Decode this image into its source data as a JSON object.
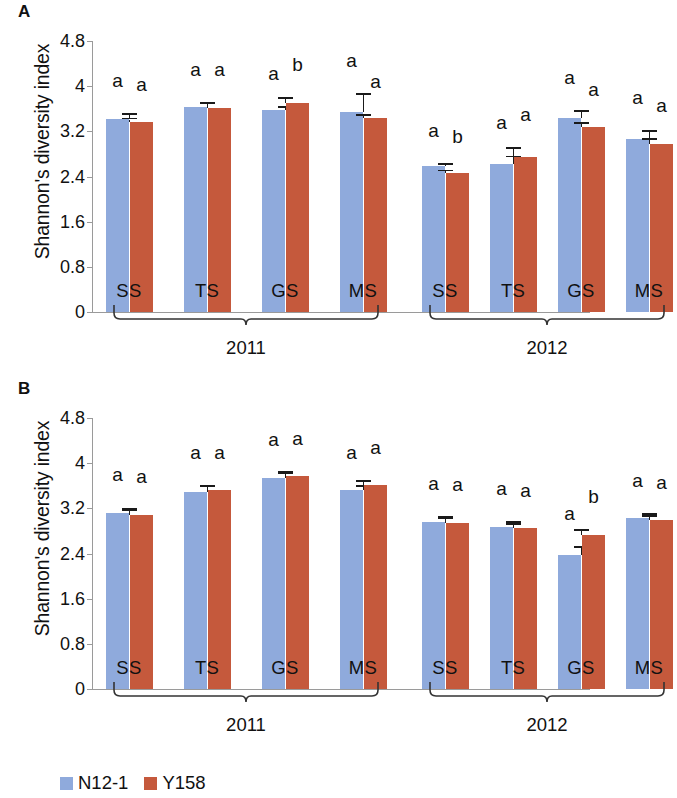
{
  "figure": {
    "panels": [
      {
        "letter": "A",
        "axis_title": "Shannon's diversity index"
      },
      {
        "letter": "B",
        "axis_title": "Shannon's diversity index"
      }
    ],
    "legend": [
      {
        "label": "N12-1",
        "color": "#8faadc"
      },
      {
        "label": "Y158",
        "color": "#c5593c"
      }
    ],
    "year_groups": [
      "2011",
      "2012"
    ]
  },
  "chart_data": [
    {
      "type": "bar",
      "panel": "A",
      "title": "",
      "xlabel": "",
      "ylabel": "Shannon's diversity index",
      "ylim": [
        0,
        4.8
      ],
      "yticks": [
        0,
        0.8,
        1.6,
        2.4,
        3.2,
        4,
        4.8
      ],
      "ytick_labels": [
        "0",
        "0.8",
        "1.6",
        "2.4",
        "3.2",
        "4",
        "4.8"
      ],
      "grid": false,
      "legend_position": "bottom",
      "groups": [
        "2011",
        "2012"
      ],
      "categories": [
        "SS",
        "TS",
        "GS",
        "MS",
        "SS",
        "TS",
        "GS",
        "MS"
      ],
      "category_group": [
        "2011",
        "2011",
        "2011",
        "2011",
        "2012",
        "2012",
        "2012",
        "2012"
      ],
      "series": [
        {
          "name": "N12-1",
          "color": "#8faadc",
          "values": [
            3.42,
            3.63,
            3.58,
            3.55,
            2.58,
            2.62,
            3.43,
            3.07
          ],
          "errors": [
            0.07,
            0.06,
            0.03,
            0.3,
            0.02,
            0.12,
            0.12,
            0.12
          ],
          "letters": [
            "a",
            "a",
            "a",
            "a",
            "a",
            "a",
            "a",
            "a"
          ]
        },
        {
          "name": "Y158",
          "color": "#c5593c",
          "values": [
            3.36,
            3.62,
            3.7,
            3.43,
            2.47,
            2.75,
            3.27,
            2.98
          ],
          "errors": [
            0.05,
            0.06,
            0.08,
            0.05,
            0.02,
            0.14,
            0.06,
            0.07
          ],
          "letters": [
            "a",
            "a",
            "b",
            "a",
            "b",
            "a",
            "a",
            "a"
          ]
        }
      ]
    },
    {
      "type": "bar",
      "panel": "B",
      "title": "",
      "xlabel": "",
      "ylabel": "Shannon's diversity index",
      "ylim": [
        0,
        4.8
      ],
      "yticks": [
        0,
        0.8,
        1.6,
        2.4,
        3.2,
        4,
        4.8
      ],
      "ytick_labels": [
        "0",
        "0.8",
        "1.6",
        "2.4",
        "3.2",
        "4",
        "4.8"
      ],
      "grid": false,
      "legend_position": "bottom",
      "groups": [
        "2011",
        "2012"
      ],
      "categories": [
        "SS",
        "TS",
        "GS",
        "MS",
        "SS",
        "TS",
        "GS",
        "MS"
      ],
      "category_group": [
        "2011",
        "2011",
        "2011",
        "2011",
        "2012",
        "2012",
        "2012",
        "2012"
      ],
      "series": [
        {
          "name": "N12-1",
          "color": "#8faadc",
          "values": [
            3.12,
            3.49,
            3.73,
            3.52,
            2.95,
            2.87,
            2.38,
            3.03
          ],
          "errors": [
            0.06,
            0.09,
            0.07,
            0.06,
            0.08,
            0.07,
            0.12,
            0.06
          ],
          "letters": [
            "a",
            "a",
            "a",
            "a",
            "a",
            "a",
            "a",
            "a"
          ]
        },
        {
          "name": "Y158",
          "color": "#c5593c",
          "values": [
            3.09,
            3.52,
            3.77,
            3.61,
            2.94,
            2.85,
            2.72,
            3.0
          ],
          "errors": [
            0.06,
            0.05,
            0.06,
            0.06,
            0.07,
            0.05,
            0.08,
            0.05
          ],
          "letters": [
            "a",
            "a",
            "a",
            "a",
            "a",
            "a",
            "b",
            "a"
          ]
        }
      ]
    }
  ]
}
